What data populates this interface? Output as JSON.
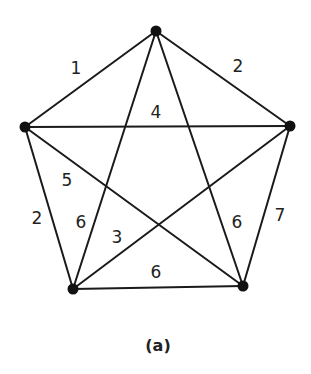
{
  "diagram": {
    "type": "weighted-complete-graph",
    "caption": "(a)",
    "vertices": [
      {
        "id": "top",
        "x": 156,
        "y": 31
      },
      {
        "id": "left",
        "x": 25,
        "y": 127
      },
      {
        "id": "right",
        "x": 290,
        "y": 126
      },
      {
        "id": "bottom-left",
        "x": 73,
        "y": 289
      },
      {
        "id": "bottom-right",
        "x": 243,
        "y": 286
      }
    ],
    "edges": [
      {
        "id": "top-left",
        "from": "top",
        "to": "left",
        "weight": "1",
        "label_x": 76,
        "label_y": 68
      },
      {
        "id": "top-right",
        "from": "top",
        "to": "right",
        "weight": "2",
        "label_x": 238,
        "label_y": 66
      },
      {
        "id": "left-right",
        "from": "left",
        "to": "right",
        "weight": "4",
        "label_x": 156,
        "label_y": 112
      },
      {
        "id": "left-bottom-right",
        "from": "left",
        "to": "bottom-right",
        "weight": "5",
        "label_x": 67,
        "label_y": 180
      },
      {
        "id": "left-bottom-left",
        "from": "left",
        "to": "bottom-left",
        "weight": "2",
        "label_x": 37,
        "label_y": 218
      },
      {
        "id": "top-bottom-left",
        "from": "top",
        "to": "bottom-left",
        "weight": "6",
        "label_x": 81,
        "label_y": 222
      },
      {
        "id": "right-bottom-left",
        "from": "right",
        "to": "bottom-left",
        "weight": "3",
        "label_x": 117,
        "label_y": 237
      },
      {
        "id": "top-bottom-right",
        "from": "top",
        "to": "bottom-right",
        "weight": "6",
        "label_x": 237,
        "label_y": 222
      },
      {
        "id": "right-bottom-right",
        "from": "right",
        "to": "bottom-right",
        "weight": "7",
        "label_x": 280,
        "label_y": 215
      },
      {
        "id": "bottom-left-bottom-right",
        "from": "bottom-left",
        "to": "bottom-right",
        "weight": "6",
        "label_x": 156,
        "label_y": 272
      }
    ],
    "colors": {
      "edge": "#1a1a1a",
      "vertex": "#111111",
      "text": "#222222",
      "background": "#ffffff"
    }
  }
}
